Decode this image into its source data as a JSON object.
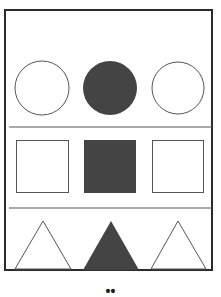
{
  "figure": {
    "rows": [
      {
        "shape": "circle",
        "items": [
          "outline",
          "filled",
          "outline"
        ]
      },
      {
        "shape": "square",
        "items": [
          "outline",
          "filled",
          "outline"
        ]
      },
      {
        "shape": "triangle",
        "items": [
          "outline",
          "filled",
          "outline"
        ]
      }
    ],
    "colors": {
      "fill": "#444444",
      "stroke": "#555555",
      "frame": "#2b2b2b",
      "divider": "#555555"
    },
    "footer_text": "••"
  }
}
